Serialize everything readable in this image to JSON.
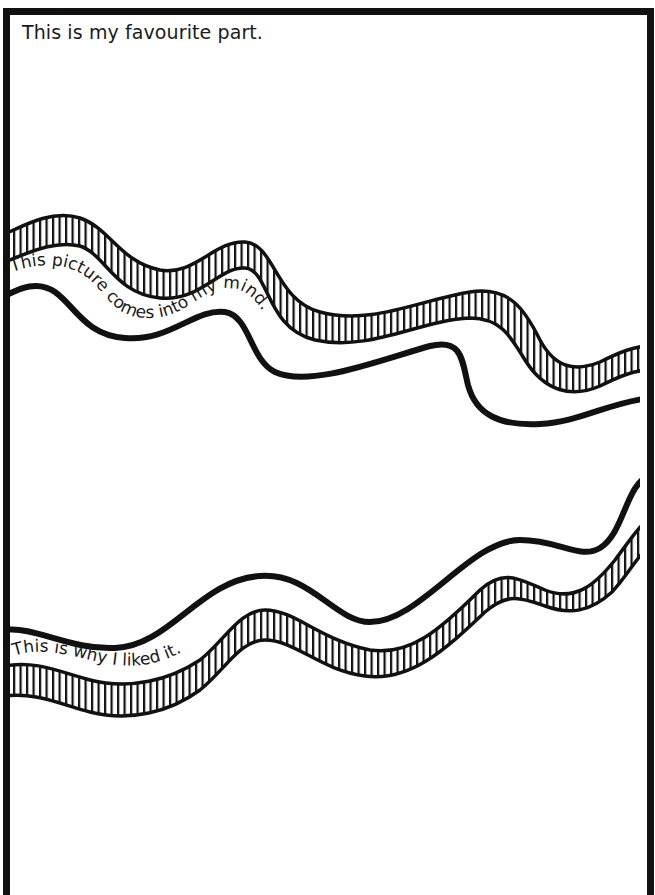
{
  "page": {
    "heading": "This is my favourite part."
  },
  "ribbons": [
    {
      "id": "top-ribbon",
      "text": "This picture comes into my mind.",
      "style": "hatched-band-above-solid-line"
    },
    {
      "id": "bottom-ribbon",
      "text": "This is why I liked it.",
      "style": "solid-line-above-hatched-band"
    }
  ],
  "colors": {
    "ink": "#111111",
    "paper": "#ffffff"
  }
}
